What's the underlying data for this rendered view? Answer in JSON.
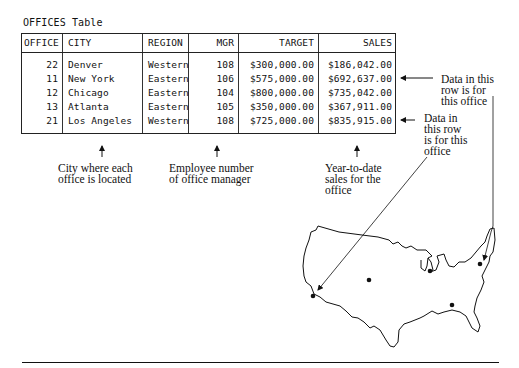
{
  "table": {
    "title": "OFFICES Table",
    "columns": [
      "OFFICE",
      "CITY",
      "REGION",
      "MGR",
      "TARGET",
      "SALES"
    ],
    "rows": [
      {
        "office": "22",
        "city": "Denver",
        "region": "Western",
        "mgr": "108",
        "target": "$300,000.00",
        "sales": "$186,042.00"
      },
      {
        "office": "11",
        "city": "New York",
        "region": "Eastern",
        "mgr": "106",
        "target": "$575,000.00",
        "sales": "$692,637.00"
      },
      {
        "office": "12",
        "city": "Chicago",
        "region": "Eastern",
        "mgr": "104",
        "target": "$800,000.00",
        "sales": "$735,042.00"
      },
      {
        "office": "13",
        "city": "Atlanta",
        "region": "Eastern",
        "mgr": "105",
        "target": "$350,000.00",
        "sales": "$367,911.00"
      },
      {
        "office": "21",
        "city": "Los Angeles",
        "region": "Western",
        "mgr": "108",
        "target": "$725,000.00",
        "sales": "$835,915.00"
      }
    ]
  },
  "annotations": {
    "city": [
      "City where each",
      "office is located"
    ],
    "mgr": [
      "Employee number",
      "of office manager"
    ],
    "sales": [
      "Year-to-date",
      "sales for the",
      "office"
    ],
    "row_ny": [
      "Data in this",
      "row is for",
      "this office"
    ],
    "row_la": [
      "Data in",
      "this row",
      "is for this",
      "office"
    ]
  },
  "map": {
    "label": "United States office locations",
    "offices": [
      "Denver",
      "New York",
      "Chicago",
      "Atlanta",
      "Los Angeles"
    ]
  },
  "colors": {
    "ink": "#111111",
    "paper": "#ffffff"
  }
}
